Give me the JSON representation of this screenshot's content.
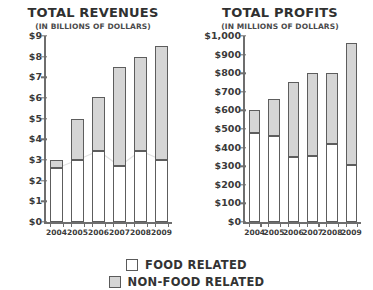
{
  "legend": {
    "items": [
      {
        "label": "FOOD RELATED",
        "swatch": "food",
        "color": "#ffffff"
      },
      {
        "label": "NON-FOOD RELATED",
        "swatch": "other",
        "color": "#d5d5d5"
      }
    ]
  },
  "chart_data": [
    {
      "type": "bar",
      "stacked": true,
      "title": "TOTAL REVENUES",
      "subtitle": "(IN BILLIONS OF DOLLARS)",
      "xlabel": "",
      "ylabel": "",
      "categories": [
        "2004",
        "2005",
        "2006",
        "2007",
        "2008",
        "2009"
      ],
      "ylim": [
        0,
        9
      ],
      "ytick_values": [
        0,
        1,
        2,
        3,
        4,
        5,
        6,
        7,
        8,
        9
      ],
      "ytick_labels": [
        "$0",
        "$1",
        "$2",
        "$3",
        "$4",
        "$5",
        "$6",
        "$7",
        "$8",
        "$9"
      ],
      "grid": false,
      "legend_position": "bottom",
      "series": [
        {
          "name": "FOOD RELATED",
          "color": "#ffffff",
          "values": [
            2.6,
            3.0,
            3.45,
            2.7,
            3.45,
            3.0
          ]
        },
        {
          "name": "NON-FOOD RELATED",
          "color": "#d5d5d5",
          "values": [
            0.4,
            2.0,
            2.6,
            4.8,
            4.55,
            5.5
          ]
        }
      ],
      "totals": [
        3.0,
        5.0,
        6.05,
        7.5,
        8.0,
        8.5
      ]
    },
    {
      "type": "bar",
      "stacked": true,
      "title": "TOTAL PROFITS",
      "subtitle": "(IN MILLIONS OF DOLLARS)",
      "xlabel": "",
      "ylabel": "",
      "categories": [
        "2004",
        "2005",
        "2006",
        "2007",
        "2008",
        "2009"
      ],
      "ylim": [
        0,
        1000
      ],
      "ytick_values": [
        0,
        100,
        200,
        300,
        400,
        500,
        600,
        700,
        800,
        900,
        1000
      ],
      "ytick_labels": [
        "$0",
        "$100",
        "$200",
        "$300",
        "$400",
        "$500",
        "$600",
        "$700",
        "$800",
        "$900",
        "$1,000"
      ],
      "grid": false,
      "legend_position": "bottom",
      "series": [
        {
          "name": "FOOD RELATED",
          "color": "#ffffff",
          "values": [
            480,
            460,
            350,
            355,
            420,
            305
          ]
        },
        {
          "name": "NON-FOOD RELATED",
          "color": "#d5d5d5",
          "values": [
            120,
            200,
            405,
            445,
            380,
            655
          ]
        }
      ],
      "totals": [
        600,
        660,
        755,
        800,
        800,
        960
      ]
    }
  ]
}
